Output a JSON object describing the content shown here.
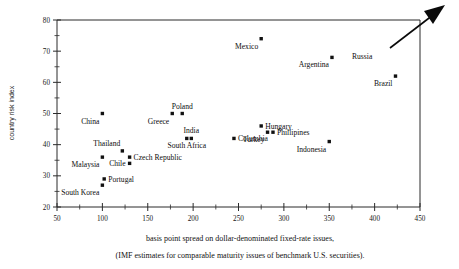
{
  "chart_data": {
    "type": "scatter",
    "title": "",
    "xlabel": "basis point spread on dollar-denominated fixed-rate issues,",
    "xlabel_line2": "(IMF estimates for comparable maturity issues of benchmark U.S. securities).",
    "ylabel": "country risk index",
    "xlim": [
      50,
      450
    ],
    "ylim": [
      20,
      80
    ],
    "xticks": [
      50,
      100,
      150,
      200,
      250,
      300,
      350,
      400,
      450
    ],
    "xtick_labels": [
      "50",
      "100",
      "150",
      "200",
      "250",
      "300",
      "350",
      "400",
      "450"
    ],
    "xtick_minor_step": 25,
    "yticks": [
      20,
      30,
      40,
      50,
      60,
      70,
      80
    ],
    "ytick_labels": [
      "20",
      "30",
      "40",
      "50",
      "60",
      "70",
      "80"
    ],
    "ytick_minor_step": 5,
    "grid": false,
    "legend": false,
    "points": [
      {
        "label": "China",
        "x": 100,
        "y": 50,
        "label_pos": "below-left"
      },
      {
        "label": "Malaysia",
        "x": 100,
        "y": 36,
        "label_pos": "below-left"
      },
      {
        "label": "South Korea",
        "x": 100,
        "y": 27,
        "label_pos": "below-left"
      },
      {
        "label": "Portugal",
        "x": 102,
        "y": 29,
        "label_pos": "right"
      },
      {
        "label": "Thailand",
        "x": 122,
        "y": 38,
        "label_pos": "above-left"
      },
      {
        "label": "Chile",
        "x": 130,
        "y": 34,
        "label_pos": "left"
      },
      {
        "label": "Czech Republic",
        "x": 130,
        "y": 36,
        "label_pos": "right"
      },
      {
        "label": "Greece",
        "x": 177,
        "y": 50,
        "label_pos": "below-left"
      },
      {
        "label": "Poland",
        "x": 188,
        "y": 50,
        "label_pos": "above"
      },
      {
        "label": "South Africa",
        "x": 193,
        "y": 42,
        "label_pos": "below"
      },
      {
        "label": "India",
        "x": 198,
        "y": 42,
        "label_pos": "above"
      },
      {
        "label": "Columbia",
        "x": 245,
        "y": 42,
        "label_pos": "right"
      },
      {
        "label": "Mexico",
        "x": 275,
        "y": 74,
        "label_pos": "below-left"
      },
      {
        "label": "Hungary",
        "x": 275,
        "y": 46,
        "label_pos": "right"
      },
      {
        "label": "Turkey",
        "x": 282,
        "y": 44,
        "label_pos": "below-left"
      },
      {
        "label": "Phillipines",
        "x": 288,
        "y": 44,
        "label_pos": "right"
      },
      {
        "label": "Indonesia",
        "x": 350,
        "y": 41,
        "label_pos": "below-left"
      },
      {
        "label": "Argentina",
        "x": 353,
        "y": 68,
        "label_pos": "below-left"
      },
      {
        "label": "Brazil",
        "x": 423,
        "y": 62,
        "label_pos": "below-left"
      },
      {
        "label": "Russia",
        "x": 450,
        "y": 80,
        "label_pos": "arrow"
      }
    ],
    "annotations": [
      {
        "name": "russia-arrow",
        "label": "Russia",
        "note": "arrow pointing up-right beyond top-right corner"
      }
    ]
  },
  "colors": {
    "marker": "#111111",
    "axis": "#2b2b2b",
    "text": "#0d0d0d",
    "background": "#ffffff"
  }
}
